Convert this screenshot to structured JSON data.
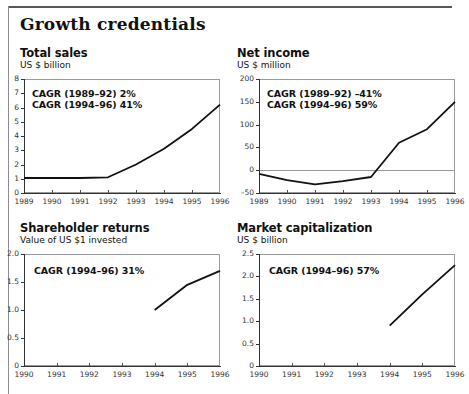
{
  "page": {
    "title": "Growth credentials"
  },
  "panels": [
    {
      "id": "total-sales",
      "title": "Total sales",
      "subtitle": "US $ billion",
      "annotations": [
        "CAGR (1989–92) 2%",
        "CAGR (1994–96) 41%"
      ]
    },
    {
      "id": "net-income",
      "title": "Net income",
      "subtitle": "US $ million",
      "annotations": [
        "CAGR (1989–92) –41%",
        "CAGR (1994–96) 59%"
      ]
    },
    {
      "id": "shareholder-returns",
      "title": "Shareholder returns",
      "subtitle": "Value of US $1 invested",
      "annotations": [
        "CAGR (1994–96) 31%"
      ]
    },
    {
      "id": "market-capitalization",
      "title": "Market capitalization",
      "subtitle": "US $ billion",
      "annotations": [
        "CAGR (1994–96) 57%"
      ]
    }
  ],
  "chart_data": [
    {
      "type": "line",
      "title": "Total sales",
      "subtitle": "US $ billion",
      "xlabel": "",
      "ylabel": "US $ billion",
      "x": [
        1989,
        1990,
        1991,
        1992,
        1993,
        1994,
        1995,
        1996
      ],
      "values": [
        1.05,
        1.05,
        1.05,
        1.1,
        2.0,
        3.1,
        4.5,
        6.2
      ],
      "xticklabels": [
        "1989",
        "1990",
        "1991",
        "1992",
        "1993",
        "1994",
        "1995",
        "1996"
      ],
      "yticks": [
        0,
        1,
        2,
        3,
        4,
        5,
        6,
        7,
        8
      ],
      "yticklabels": [
        "0",
        "1",
        "2",
        "3",
        "4",
        "5",
        "6",
        "7",
        "8"
      ],
      "ylim": [
        0,
        8
      ],
      "xlim": [
        1989,
        1996
      ],
      "grid": false,
      "legend": "none",
      "annotations": [
        "CAGR (1989–92) 2%",
        "CAGR (1994–96) 41%"
      ]
    },
    {
      "type": "line",
      "title": "Net income",
      "subtitle": "US $ million",
      "xlabel": "",
      "ylabel": "US $ million",
      "x": [
        1989,
        1990,
        1991,
        1992,
        1993,
        1994,
        1995,
        1996
      ],
      "values": [
        -8,
        -22,
        -31,
        -24,
        -15,
        60,
        90,
        150
      ],
      "xticklabels": [
        "1989",
        "1990",
        "1991",
        "1992",
        "1993",
        "1994",
        "1995",
        "1996"
      ],
      "yticks": [
        -50,
        0,
        50,
        100,
        150,
        200
      ],
      "yticklabels": [
        "-50",
        "0",
        "50",
        "100",
        "150",
        "200"
      ],
      "ylim": [
        -50,
        200
      ],
      "xlim": [
        1989,
        1996
      ],
      "grid": false,
      "zeroline": true,
      "legend": "none",
      "annotations": [
        "CAGR (1989–92) –41%",
        "CAGR (1994–96) 59%"
      ]
    },
    {
      "type": "line",
      "title": "Shareholder returns",
      "subtitle": "Value of US $1 invested",
      "xlabel": "",
      "ylabel": "Value of US $1 invested",
      "x": [
        1994,
        1995,
        1996
      ],
      "values": [
        1.0,
        1.45,
        1.7
      ],
      "xticklabels": [
        "1990",
        "1991",
        "1992",
        "1993",
        "1994",
        "1995",
        "1996"
      ],
      "yticks": [
        0,
        0.5,
        1.0,
        1.5,
        2.0
      ],
      "yticklabels": [
        "0",
        "0.5",
        "1.0",
        "1.5",
        "2.0"
      ],
      "ylim": [
        0,
        2.0
      ],
      "xlim": [
        1990,
        1996
      ],
      "grid": false,
      "legend": "none",
      "annotations": [
        "CAGR (1994–96) 31%"
      ]
    },
    {
      "type": "line",
      "title": "Market capitalization",
      "subtitle": "US $ billion",
      "xlabel": "",
      "ylabel": "US $ billion",
      "x": [
        1994,
        1995,
        1996
      ],
      "values": [
        0.9,
        1.6,
        2.25
      ],
      "xticklabels": [
        "1990",
        "1991",
        "1992",
        "1993",
        "1994",
        "1995",
        "1996"
      ],
      "yticks": [
        0,
        0.5,
        1.0,
        1.5,
        2.0,
        2.5
      ],
      "yticklabels": [
        "0",
        "0.5",
        "1.0",
        "1.5",
        "2.0",
        "2.5"
      ],
      "ylim": [
        0,
        2.5
      ],
      "xlim": [
        1990,
        1996
      ],
      "grid": false,
      "legend": "none",
      "annotations": [
        "CAGR (1994–96) 57%"
      ]
    }
  ]
}
